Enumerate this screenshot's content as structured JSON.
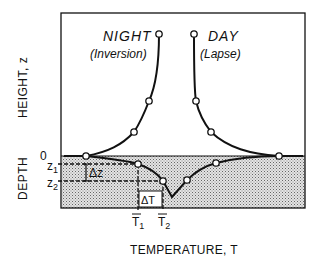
{
  "diagram": {
    "curves": {
      "night": {
        "title": "NIGHT",
        "subtitle": "(Inversion)"
      },
      "day": {
        "title": "DAY",
        "subtitle": "(Lapse)"
      }
    },
    "axes": {
      "y_upper_label": "HEIGHT, z",
      "y_lower_label": "DEPTH",
      "x_label": "TEMPERATURE, T",
      "surface_tick": "0",
      "z1": "z",
      "z1_sub": "1",
      "z2": "z",
      "z2_sub": "2",
      "t1": "T",
      "t1_sub": "1",
      "t2": "T",
      "t2_sub": "2"
    },
    "annotations": {
      "delta_z": "Δz",
      "delta_t": "ΔT"
    },
    "colors": {
      "ink": "#111111",
      "ground_fill": "#c8c8c8",
      "background": "#ffffff"
    }
  }
}
